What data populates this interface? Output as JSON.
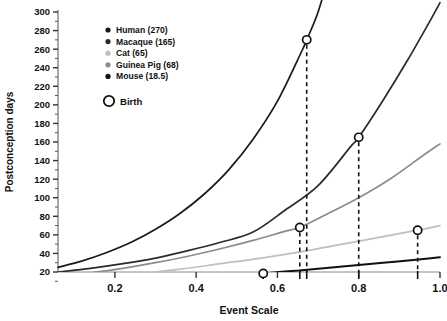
{
  "chart_data": {
    "type": "line",
    "title": "",
    "xlabel": "Event Scale",
    "ylabel": "Postconception days",
    "xlim": [
      0.06,
      1.0
    ],
    "ylim": [
      0,
      300
    ],
    "grid": false,
    "legend_position": "top-left-inside",
    "xticks": [
      "0.2",
      "0.4",
      "0.6",
      "0.8",
      "1.0"
    ],
    "xtick_values": [
      0.2,
      0.4,
      0.6,
      0.8,
      1.0
    ],
    "yticks": [
      "20",
      "40",
      "60",
      "80",
      "100",
      "120",
      "140",
      "160",
      "180",
      "200",
      "220",
      "240",
      "260",
      "280",
      "300"
    ],
    "ytick_values": [
      20,
      40,
      60,
      80,
      100,
      120,
      140,
      160,
      180,
      200,
      220,
      240,
      260,
      280,
      300
    ],
    "series": [
      {
        "name": "Human",
        "legend_label": "Human (270)",
        "color": "#1a1a1a",
        "birth_days": 270,
        "birth_event_scale": 0.672,
        "x": [
          0.06,
          0.12,
          0.18,
          0.24,
          0.3,
          0.36,
          0.42,
          0.48,
          0.54,
          0.6,
          0.66,
          0.672,
          0.7,
          0.73
        ],
        "y": [
          25,
          32,
          41,
          52,
          66,
          83,
          104,
          130,
          163,
          204,
          258,
          270,
          300,
          345
        ]
      },
      {
        "name": "Macaque",
        "legend_label": "Macaque (165)",
        "color": "#2b2b2b",
        "birth_days": 165,
        "birth_event_scale": 0.8,
        "x": [
          0.06,
          0.14,
          0.22,
          0.3,
          0.38,
          0.46,
          0.54,
          0.62,
          0.7,
          0.78,
          0.8,
          0.86,
          0.92,
          0.98,
          1.0
        ],
        "y": [
          20,
          24,
          29,
          35,
          43,
          52,
          63,
          87,
          113,
          155,
          165,
          205,
          248,
          294,
          310
        ]
      },
      {
        "name": "Guinea Pig",
        "legend_label": "Guinea Pig (68)",
        "color": "#8c8c8c",
        "birth_days": 68,
        "birth_event_scale": 0.655,
        "x": [
          0.06,
          0.14,
          0.22,
          0.3,
          0.38,
          0.46,
          0.54,
          0.62,
          0.655,
          0.72,
          0.8,
          0.88,
          0.96,
          1.0
        ],
        "y": [
          14,
          19,
          24,
          30,
          37,
          45,
          54,
          64,
          68,
          82,
          100,
          121,
          146,
          158
        ]
      },
      {
        "name": "Cat",
        "legend_label": "Cat (65)",
        "color": "#bfbfbf",
        "birth_days": 65,
        "birth_event_scale": 0.945,
        "x": [
          0.06,
          0.16,
          0.26,
          0.36,
          0.46,
          0.56,
          0.66,
          0.76,
          0.86,
          0.945,
          1.0
        ],
        "y": [
          10,
          14,
          18,
          23,
          29,
          35,
          42,
          50,
          58,
          65,
          70
        ]
      },
      {
        "name": "Mouse",
        "legend_label": "Mouse (18.5)",
        "color": "#111111",
        "birth_days": 18.5,
        "birth_event_scale": 0.565,
        "x": [
          0.06,
          0.16,
          0.26,
          0.36,
          0.46,
          0.565,
          0.66,
          0.76,
          0.86,
          0.96,
          1.0
        ],
        "y": [
          8,
          10,
          12,
          14,
          16.5,
          18.5,
          22,
          26,
          30,
          34,
          36
        ]
      }
    ],
    "birth_markers": [
      {
        "name": "Mouse",
        "x": 0.565,
        "y": 18.5
      },
      {
        "name": "Guinea Pig",
        "x": 0.655,
        "y": 68
      },
      {
        "name": "Human",
        "x": 0.672,
        "y": 270
      },
      {
        "name": "Macaque",
        "x": 0.8,
        "y": 165
      },
      {
        "name": "Cat",
        "x": 0.945,
        "y": 65
      }
    ],
    "legend": {
      "entries": [
        {
          "label": "Human (270)",
          "color": "#1a1a1a"
        },
        {
          "label": "Macaque (165)",
          "color": "#2b2b2b"
        },
        {
          "label": "Cat (65)",
          "color": "#bfbfbf"
        },
        {
          "label": "Guinea Pig (68)",
          "color": "#8c8c8c"
        },
        {
          "label": "Mouse (18.5)",
          "color": "#111111"
        }
      ],
      "birth_key_label": "Birth"
    }
  }
}
